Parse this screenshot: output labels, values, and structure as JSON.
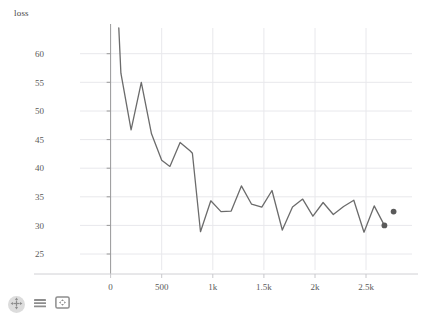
{
  "chart_data": {
    "type": "line",
    "title": "",
    "subtitle": "",
    "ylabel": "loss",
    "xlabel": "",
    "grid": true,
    "legend": "none",
    "xlim": [
      -300,
      2950
    ],
    "ylim": [
      22.2,
      64.5
    ],
    "xticks": [
      0,
      500,
      1000,
      1500,
      2000,
      2500
    ],
    "xtick_labels": [
      "0",
      "500",
      "1k",
      "1.5k",
      "2k",
      "2.5k"
    ],
    "yticks": [
      25,
      30,
      35,
      40,
      45,
      50,
      55,
      60
    ],
    "ytick_labels": [
      "25",
      "30",
      "35",
      "40",
      "45",
      "50",
      "55",
      "60"
    ],
    "line_color": "#6b6b6b",
    "grid_color": "#e8e8ec",
    "axis_color": "#9a9a9a",
    "marker_color": "#5a5a5a",
    "series": [
      {
        "name": "loss",
        "x": [
          80,
          100,
          200,
          300,
          400,
          500,
          580,
          680,
          780,
          800,
          880,
          980,
          1080,
          1180,
          1280,
          1380,
          1480,
          1580,
          1680,
          1780,
          1880,
          1980,
          2080,
          2180,
          2280,
          2380,
          2480,
          2580,
          2680
        ],
        "y": [
          64.5,
          56.6,
          46.7,
          55.0,
          46.0,
          41.4,
          40.3,
          44.5,
          43.0,
          42.6,
          28.9,
          34.3,
          32.4,
          32.5,
          36.9,
          33.7,
          33.2,
          36.1,
          29.2,
          33.2,
          34.6,
          31.6,
          34.0,
          31.9,
          33.3,
          34.4,
          28.8,
          33.4,
          30.0
        ]
      }
    ],
    "markers": [
      {
        "x": 2680,
        "y": 30.0,
        "label": ""
      },
      {
        "x": 2770,
        "y": 32.4,
        "label": ""
      }
    ]
  },
  "toolbar": {
    "items": [
      {
        "name": "pan-tool",
        "icon": "move-arrows-icon",
        "label": ""
      },
      {
        "name": "list-tool",
        "icon": "menu-lines-icon",
        "label": ""
      },
      {
        "name": "fullscreen-tool",
        "icon": "expand-icon",
        "label": ""
      }
    ]
  }
}
